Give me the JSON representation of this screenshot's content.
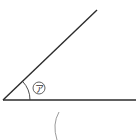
{
  "diagram": {
    "type": "angle",
    "angle_label": "ア",
    "colors": {
      "line": "#2b2b2b",
      "arc": "#3a3a3a",
      "protractor_arc": "#9a9a9a"
    }
  }
}
